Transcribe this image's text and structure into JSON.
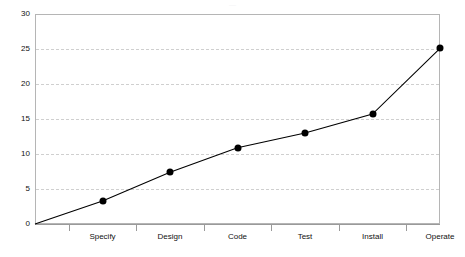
{
  "chart_data": {
    "type": "line",
    "title": "",
    "subtitle": "",
    "xlabel": "",
    "ylabel": "",
    "categories": [
      "Specify",
      "Design",
      "Code",
      "Test",
      "Install",
      "Operate"
    ],
    "values": [
      3.3,
      7.4,
      10.9,
      13.0,
      15.7,
      25.1
    ],
    "origin_point": {
      "label": "",
      "value": 0
    },
    "ylim": [
      0,
      30
    ],
    "ytick_labels": [
      "0",
      "5",
      "10",
      "15",
      "20",
      "25",
      "30"
    ],
    "ytick_values": [
      0,
      5,
      10,
      15,
      20,
      25,
      30
    ],
    "grid": "horizontal-dashed",
    "legend": "none",
    "series": [
      {
        "name": "",
        "values": [
          3.3,
          7.4,
          10.9,
          13.0,
          15.7,
          25.1
        ],
        "line_color": "#000000",
        "marker_color": "#000000",
        "marker": "filled-circle"
      }
    ],
    "colors": {
      "line": "#000000",
      "marker": "#000000",
      "grid": "#cfcfcf",
      "frame": "#b5b5b5",
      "axis": "#9a9a9a",
      "text": "#111111",
      "background": "#ffffff"
    }
  },
  "header": {
    "cropped_title_fragment": "—"
  }
}
